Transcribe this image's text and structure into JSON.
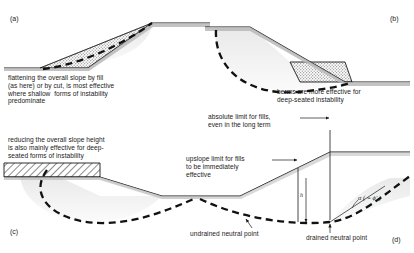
{
  "figure": {
    "background": "#ffffff",
    "line_color": "#1a1a1a",
    "ground_fill": "#b9b9b9",
    "slip_surface_color": "#111111",
    "fill_tone": "#d9d9d9",
    "hatch_color": "#222222"
  },
  "panels": {
    "a": {
      "label": "(a)",
      "caption": "flattening the overall slope by fill\n(as here) or by cut, is most effective\nwhere shallow  forms of instability\npredominate"
    },
    "b": {
      "label": "(b)",
      "caption": "berms are more effective for\ndeep-seated instability"
    },
    "c": {
      "label": "(c)",
      "caption": "reducing the overall slope height\nis also mainly effective for deep-\nseated forms of instability"
    },
    "d": {
      "label": "(d)",
      "annotations": {
        "absolute_limit": "absolute limit for fills,\neven in the long term",
        "upslope_limit": "upslope limit for fills\nto be immediately\neffective",
        "undrained_neutral_point": "undrained neutral point",
        "drained_neutral_point": "drained neutral point",
        "angle_symbol": "α ( = ϕ'ᵣ)",
        "height_symbol": "h"
      }
    }
  }
}
